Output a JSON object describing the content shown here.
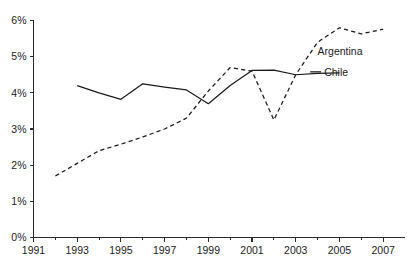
{
  "chart_data": {
    "type": "line",
    "title": "",
    "subtitle": "",
    "xlabel": "",
    "ylabel": "",
    "xlim": [
      1991,
      2008
    ],
    "ylim": [
      0,
      6
    ],
    "grid": false,
    "legend_position": "inline-right",
    "y_ticks": [
      0,
      1,
      2,
      3,
      4,
      5,
      6
    ],
    "y_tick_labels": [
      "0%",
      "1%",
      "2%",
      "3%",
      "4%",
      "5%",
      "6%"
    ],
    "x_ticks": [
      1991,
      1993,
      1995,
      1997,
      1999,
      2001,
      2003,
      2005,
      2007
    ],
    "x_tick_labels": [
      "1991",
      "1993",
      "1995",
      "1997",
      "1999",
      "2001",
      "2003",
      "2005",
      "2007"
    ],
    "x_minor_ticks": [
      1992,
      1994,
      1996,
      1998,
      2000,
      2002,
      2004,
      2006
    ],
    "series": [
      {
        "name": "Argentina",
        "style": "dashed",
        "color": "#1a1a1a",
        "x": [
          1992,
          1993,
          1994,
          1995,
          1996,
          1997,
          1998,
          1999,
          2000,
          2001,
          2002,
          2003,
          2004,
          2005,
          2006,
          2007
        ],
        "values": [
          1.7,
          2.05,
          2.4,
          2.58,
          2.78,
          3.0,
          3.3,
          4.05,
          4.7,
          4.6,
          3.25,
          4.5,
          5.4,
          5.8,
          5.63,
          5.76
        ],
        "label_x": 2004.0,
        "label_y": 5.15
      },
      {
        "name": "Chile",
        "style": "solid",
        "color": "#1a1a1a",
        "x": [
          1993,
          1994,
          1995,
          1996,
          1997,
          1998,
          1999,
          2000,
          2001,
          2002,
          2003,
          2004,
          2005
        ],
        "values": [
          4.2,
          4.0,
          3.82,
          4.25,
          4.16,
          4.08,
          3.7,
          4.2,
          4.62,
          4.63,
          4.5,
          4.54,
          4.55
        ],
        "label_x": 2004.3,
        "label_y": 4.58
      }
    ]
  },
  "labels": {
    "argentina": "Argentina",
    "chile": "Chile"
  },
  "colors": {
    "line": "#1a1a1a",
    "axis": "#2b2b2b",
    "background": "#ffffff"
  }
}
